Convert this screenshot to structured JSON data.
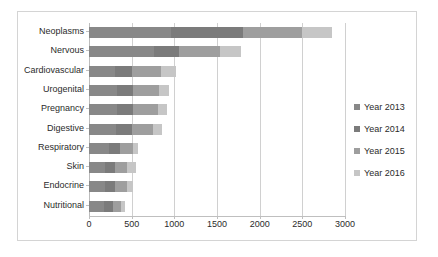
{
  "chart_data": {
    "type": "bar",
    "orientation": "horizontal",
    "stacked": true,
    "title": "",
    "xlabel": "",
    "ylabel": "",
    "xlim": [
      0,
      3000
    ],
    "xticks": [
      0,
      500,
      1000,
      1500,
      2000,
      2500,
      3000
    ],
    "xtick_labels": [
      "0",
      "500",
      "1000",
      "1500",
      "2000",
      "2500",
      "3000"
    ],
    "grid": true,
    "legend_position": "right",
    "categories": [
      "Neoplasms",
      "Nervous",
      "Cardiovascular",
      "Urogenital",
      "Pregnancy",
      "Digestive",
      "Respiratory",
      "Skin",
      "Endocrine",
      "Nutritional"
    ],
    "series": [
      {
        "name": "Year 2013",
        "color": "#888888",
        "values": [
          960,
          760,
          300,
          330,
          330,
          320,
          230,
          190,
          190,
          170
        ]
      },
      {
        "name": "Year 2014",
        "color": "#7b7b7b",
        "values": [
          840,
          290,
          200,
          190,
          190,
          180,
          130,
          120,
          120,
          110
        ]
      },
      {
        "name": "Year 2015",
        "color": "#9e9e9e",
        "values": [
          700,
          480,
          340,
          300,
          290,
          250,
          150,
          140,
          130,
          90
        ]
      },
      {
        "name": "Year 2016",
        "color": "#c6c6c6",
        "values": [
          350,
          250,
          180,
          120,
          110,
          100,
          70,
          100,
          80,
          50
        ]
      }
    ],
    "totals": [
      2850,
      1780,
      1020,
      940,
      920,
      850,
      580,
      550,
      520,
      420
    ]
  },
  "legend": {
    "items": [
      {
        "label": "Year 2013",
        "color": "#888888"
      },
      {
        "label": "Year 2014",
        "color": "#7b7b7b"
      },
      {
        "label": "Year 2015",
        "color": "#9e9e9e"
      },
      {
        "label": "Year 2016",
        "color": "#c6c6c6"
      }
    ]
  },
  "style": {
    "frame_border": "#d4d4d4",
    "gridline": "#d0d0d0",
    "axis": "#bfbfbf",
    "text": "#2b2b2b",
    "background": "#ffffff"
  }
}
